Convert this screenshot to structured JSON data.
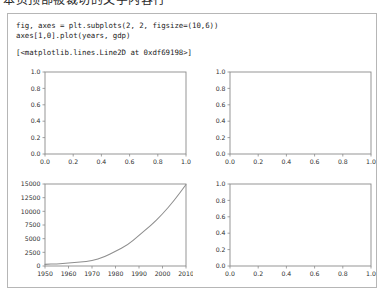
{
  "top_cut_text": "本页顶部被裁切的文字内容行",
  "notebook": {
    "code_lines": [
      "fig, axes = plt.subplots(2, 2, figsize=(10,6))",
      "axes[1,0].plot(years, gdp)"
    ],
    "output_line": "[<matplotlib.lines.Line2D at 0xdf69198>]"
  },
  "chart_data": [
    {
      "id": "subplot-top-left",
      "type": "line",
      "title": "",
      "xlabel": "",
      "ylabel": "",
      "xlim": [
        0.0,
        1.0
      ],
      "ylim": [
        0.0,
        1.0
      ],
      "xticks": [
        0.0,
        0.2,
        0.4,
        0.6,
        0.8,
        1.0
      ],
      "yticks": [
        0.0,
        0.2,
        0.4,
        0.6,
        0.8,
        1.0
      ],
      "xticklabels": [
        "0.0",
        "0.2",
        "0.4",
        "0.6",
        "0.8",
        "1.0"
      ],
      "yticklabels": [
        "0.0",
        "0.2",
        "0.4",
        "0.6",
        "0.8",
        "1.0"
      ],
      "grid": false,
      "legend": null,
      "series": [],
      "empty": true
    },
    {
      "id": "subplot-top-right",
      "type": "line",
      "title": "",
      "xlabel": "",
      "ylabel": "",
      "xlim": [
        0.0,
        1.0
      ],
      "ylim": [
        0.0,
        1.0
      ],
      "xticks": [
        0.0,
        0.2,
        0.4,
        0.6,
        0.8,
        1.0
      ],
      "yticks": [
        0.0,
        0.2,
        0.4,
        0.6,
        0.8,
        1.0
      ],
      "xticklabels": [
        "0.0",
        "0.2",
        "0.4",
        "0.6",
        "0.8",
        "1.0"
      ],
      "yticklabels": [
        "0.0",
        "0.2",
        "0.4",
        "0.6",
        "0.8",
        "1.0"
      ],
      "grid": false,
      "legend": null,
      "series": [],
      "empty": true
    },
    {
      "id": "subplot-bottom-left",
      "type": "line",
      "title": "",
      "xlabel": "",
      "ylabel": "",
      "xlim": [
        1950,
        2010
      ],
      "ylim": [
        0,
        15000
      ],
      "xticks": [
        1950,
        1960,
        1970,
        1980,
        1990,
        2000,
        2010
      ],
      "yticks": [
        0,
        2500,
        5000,
        7500,
        10000,
        12500,
        15000
      ],
      "xticklabels": [
        "1950",
        "1960",
        "1970",
        "1980",
        "1990",
        "2000",
        "2010"
      ],
      "yticklabels": [
        "0",
        "2500",
        "5000",
        "7500",
        "10000",
        "12500",
        "15000"
      ],
      "grid": false,
      "legend": null,
      "line_color": "#8e8e8e",
      "x": [
        1950,
        1955,
        1960,
        1965,
        1970,
        1975,
        1980,
        1985,
        1990,
        1995,
        2000,
        2005,
        2010
      ],
      "y": [
        300,
        400,
        550,
        700,
        950,
        1600,
        2700,
        3800,
        5600,
        7400,
        9500,
        12000,
        14900
      ],
      "empty": false
    },
    {
      "id": "subplot-bottom-right",
      "type": "line",
      "title": "",
      "xlabel": "",
      "ylabel": "",
      "xlim": [
        0.0,
        1.0
      ],
      "ylim": [
        0.0,
        1.0
      ],
      "xticks": [
        0.0,
        0.2,
        0.4,
        0.6,
        0.8,
        1.0
      ],
      "yticks": [
        0.0,
        0.2,
        0.4,
        0.6,
        0.8,
        1.0
      ],
      "xticklabels": [
        "0.0",
        "0.2",
        "0.4",
        "0.6",
        "0.8",
        "1.0"
      ],
      "yticklabels": [
        "0.0",
        "0.2",
        "0.4",
        "0.6",
        "0.8",
        "1.0"
      ],
      "grid": false,
      "legend": null,
      "series": [],
      "empty": true
    }
  ]
}
